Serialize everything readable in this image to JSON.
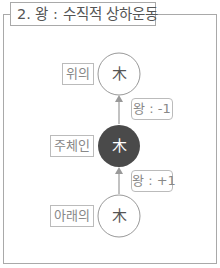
{
  "title": "2. 왕 : 수직적 상하운동",
  "nodes": [
    {
      "id": "top",
      "label": "위의",
      "glyph": "木",
      "fill": "#ffffff",
      "text_color": "#555555"
    },
    {
      "id": "center",
      "label": "주체인",
      "glyph": "木",
      "fill": "#4a4a4a",
      "text_color": "#ffffff"
    },
    {
      "id": "bottom",
      "label": "아래의",
      "glyph": "木",
      "fill": "#ffffff",
      "text_color": "#555555"
    }
  ],
  "edges": [
    {
      "from": "center",
      "to": "top",
      "label": "왕 : -1"
    },
    {
      "from": "bottom",
      "to": "center",
      "label": "왕 : +1"
    }
  ],
  "colors": {
    "border": "#a9a9a9",
    "line": "#999999",
    "dark_node": "#4a4a4a"
  }
}
